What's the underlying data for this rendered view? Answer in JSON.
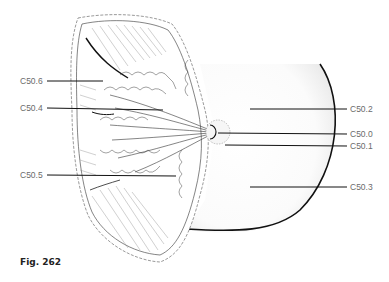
{
  "figure": {
    "caption": "Fig. 262",
    "labels": {
      "c506": "C50.6",
      "c504": "C50.4",
      "c505": "C50.5",
      "c502": "C50.2",
      "c500": "C50.0",
      "c501": "C50.1",
      "c503": "C50.3"
    },
    "line_color": "#111111",
    "label_color": "#6b6b6b"
  }
}
